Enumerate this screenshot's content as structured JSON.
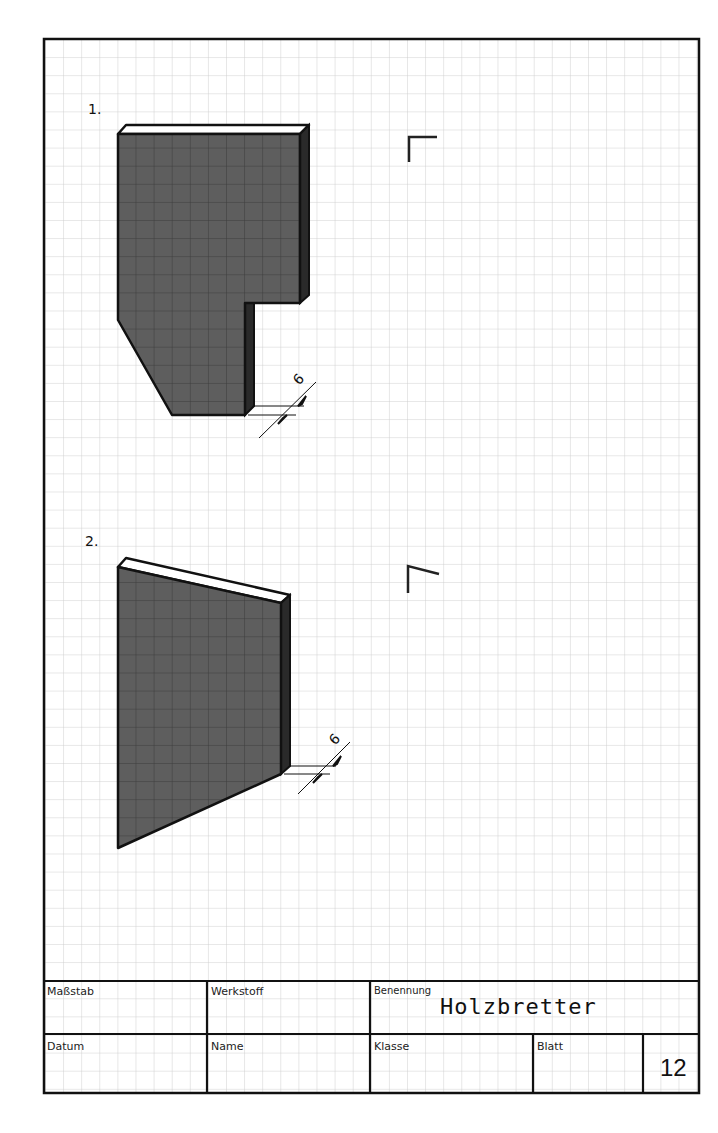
{
  "exercises": [
    {
      "number": "1.",
      "dimension_label": "6"
    },
    {
      "number": "2.",
      "dimension_label": "6"
    }
  ],
  "title_block": {
    "scale_label": "Maßstab",
    "material_label": "Werkstoff",
    "designation_label": "Benennung",
    "designation_value": "Holzbretter",
    "date_label": "Datum",
    "name_label": "Name",
    "class_label": "Klasse",
    "sheet_label": "Blatt",
    "sheet_number": "12"
  },
  "colors": {
    "border": "#111111",
    "grid": "#cfcfcf",
    "front_face": "#5a5a5a",
    "side_face": "#2a2a2a",
    "top_face": "#ffffff"
  }
}
